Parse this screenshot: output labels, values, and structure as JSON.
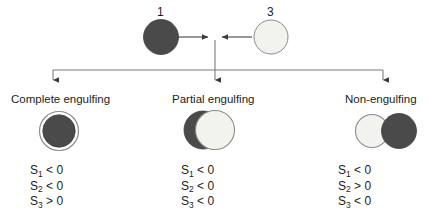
{
  "diagram": {
    "colors": {
      "dark_particle": "#4a4a4a",
      "light_particle": "#f2f2ef",
      "outline": "#8c8c8c",
      "connector": "#7d7d7d",
      "text": "#1d1d1d",
      "background": "#ffffff"
    },
    "top": {
      "particles": [
        {
          "id": "particle-1",
          "label": "1",
          "fill": "dark"
        },
        {
          "id": "particle-3",
          "label": "3",
          "fill": "light"
        }
      ],
      "arrow_left_name": "arrow-right-into-center",
      "arrow_right_name": "arrow-left-into-center"
    },
    "branches": [
      {
        "key": "complete",
        "label": "Complete engulfing",
        "icon_name": "complete-engulfing-icon",
        "conditions": [
          {
            "symbol": "S",
            "subscript": "1",
            "operator": "<",
            "value": "0"
          },
          {
            "symbol": "S",
            "subscript": "2",
            "operator": "<",
            "value": "0"
          },
          {
            "symbol": "S",
            "subscript": "3",
            "operator": ">",
            "value": "0"
          }
        ]
      },
      {
        "key": "partial",
        "label": "Partial engulfing",
        "icon_name": "partial-engulfing-icon",
        "conditions": [
          {
            "symbol": "S",
            "subscript": "1",
            "operator": "<",
            "value": "0"
          },
          {
            "symbol": "S",
            "subscript": "2",
            "operator": "<",
            "value": "0"
          },
          {
            "symbol": "S",
            "subscript": "3",
            "operator": "<",
            "value": "0"
          }
        ]
      },
      {
        "key": "non",
        "label": "Non-engulfing",
        "icon_name": "non-engulfing-icon",
        "conditions": [
          {
            "symbol": "S",
            "subscript": "1",
            "operator": "<",
            "value": "0"
          },
          {
            "symbol": "S",
            "subscript": "2",
            "operator": ">",
            "value": "0"
          },
          {
            "symbol": "S",
            "subscript": "3",
            "operator": "<",
            "value": "0"
          }
        ]
      }
    ]
  }
}
